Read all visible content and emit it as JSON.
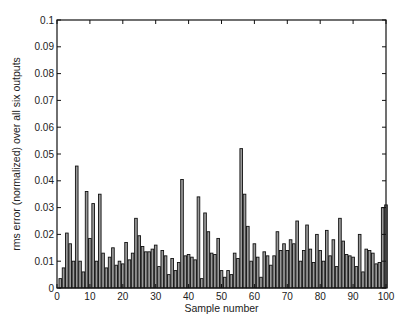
{
  "chart_data": {
    "type": "bar",
    "title": "",
    "xlabel": "Sample number",
    "ylabel": "rms error (normalized) over all six outputs",
    "xlim": [
      0,
      100
    ],
    "ylim": [
      0,
      0.1
    ],
    "grid": false,
    "legend": null,
    "xticks": [
      0,
      10,
      20,
      30,
      40,
      50,
      60,
      70,
      80,
      90,
      100
    ],
    "xtick_labels": [
      "0",
      "10",
      "20",
      "30",
      "40",
      "50",
      "60",
      "70",
      "80",
      "90",
      "100"
    ],
    "yticks": [
      0,
      0.01,
      0.02,
      0.03,
      0.04,
      0.05,
      0.06,
      0.07,
      0.08,
      0.09,
      0.1
    ],
    "ytick_labels": [
      "0",
      "0.01",
      "0.02",
      "0.03",
      "0.04",
      "0.05",
      "0.06",
      "0.07",
      "0.08",
      "0.09",
      "0.1"
    ],
    "bar_fill": "#9a9a9a",
    "bar_edge": "#111111",
    "categories": [
      1,
      2,
      3,
      4,
      5,
      6,
      7,
      8,
      9,
      10,
      11,
      12,
      13,
      14,
      15,
      16,
      17,
      18,
      19,
      20,
      21,
      22,
      23,
      24,
      25,
      26,
      27,
      28,
      29,
      30,
      31,
      32,
      33,
      34,
      35,
      36,
      37,
      38,
      39,
      40,
      41,
      42,
      43,
      44,
      45,
      46,
      47,
      48,
      49,
      50,
      51,
      52,
      53,
      54,
      55,
      56,
      57,
      58,
      59,
      60,
      61,
      62,
      63,
      64,
      65,
      66,
      67,
      68,
      69,
      70,
      71,
      72,
      73,
      74,
      75,
      76,
      77,
      78,
      79,
      80,
      81,
      82,
      83,
      84,
      85,
      86,
      87,
      88,
      89,
      90,
      91,
      92,
      93,
      94,
      95,
      96,
      97,
      98,
      99,
      100
    ],
    "values": [
      0.0035,
      0.0075,
      0.0205,
      0.0165,
      0.01,
      0.0455,
      0.01,
      0.006,
      0.036,
      0.0185,
      0.0315,
      0.01,
      0.035,
      0.013,
      0.0075,
      0.0115,
      0.015,
      0.0085,
      0.01,
      0.009,
      0.017,
      0.0105,
      0.013,
      0.026,
      0.0195,
      0.0155,
      0.0135,
      0.0135,
      0.0145,
      0.016,
      0.008,
      0.014,
      0.012,
      0.005,
      0.011,
      0.0065,
      0.0095,
      0.0405,
      0.012,
      0.0125,
      0.0115,
      0.0105,
      0.034,
      0.0035,
      0.028,
      0.021,
      0.013,
      0.0125,
      0.0185,
      0.0065,
      0.004,
      0.0065,
      0.005,
      0.013,
      0.011,
      0.052,
      0.035,
      0.023,
      0.01,
      0.0165,
      0.0115,
      0.004,
      0.0135,
      0.012,
      0.0085,
      0.012,
      0.021,
      0.014,
      0.0165,
      0.014,
      0.018,
      0.0165,
      0.025,
      0.01,
      0.014,
      0.0235,
      0.0145,
      0.0095,
      0.02,
      0.014,
      0.01,
      0.0215,
      0.012,
      0.018,
      0.008,
      0.026,
      0.0175,
      0.0125,
      0.012,
      0.0115,
      0.008,
      0.02,
      0.006,
      0.0145,
      0.014,
      0.013,
      0.009,
      0.0095,
      0.03,
      0.031
    ]
  }
}
